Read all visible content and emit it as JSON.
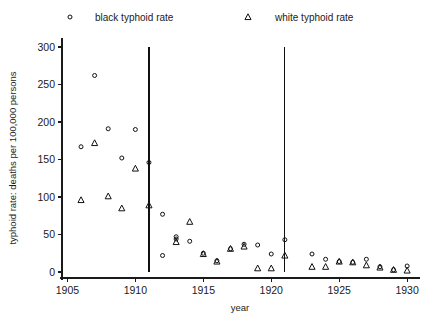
{
  "chart_data": {
    "type": "scatter",
    "title": "",
    "xlabel": "year",
    "ylabel": "typhoid rate: deaths per 100,000 persons",
    "xlim": [
      1904.6,
      1930.8
    ],
    "ylim": [
      -8,
      312
    ],
    "grid": false,
    "legend_position": "top",
    "x_ticks": [
      1905,
      1910,
      1915,
      1920,
      1925,
      1930
    ],
    "x_tick_labels": [
      "1905",
      "1910",
      "1915",
      "1920",
      "1925",
      "1930"
    ],
    "y_ticks": [
      0,
      50,
      100,
      150,
      200,
      250,
      300
    ],
    "y_tick_labels": [
      "0",
      "50",
      "100",
      "150",
      "200",
      "250",
      "300"
    ],
    "annotations": [
      {
        "name": "vertical-line-1911",
        "x": 1911,
        "y0": 0,
        "y1": 300
      },
      {
        "name": "vertical-line-1921",
        "x": 1921,
        "y0": 0,
        "y1": 300
      }
    ],
    "series": [
      {
        "name": "black typhoid rate",
        "marker": "circle",
        "color": "#111111",
        "x": [
          1906,
          1907,
          1908,
          1909,
          1910,
          1911,
          1912,
          1913,
          1914,
          1915,
          1916,
          1917,
          1918,
          1919,
          1920,
          1921,
          1923,
          1924,
          1925,
          1926,
          1927,
          1928,
          1929,
          1930
        ],
        "values": [
          167,
          262,
          191,
          152,
          190,
          146,
          77,
          44,
          41,
          25,
          15,
          31,
          37,
          36,
          24,
          43,
          24,
          17,
          14,
          13,
          17,
          7,
          3,
          8
        ]
      },
      {
        "name": "white typhoid rate",
        "marker": "triangle",
        "color": "#111111",
        "x": [
          1906,
          1907,
          1908,
          1909,
          1910,
          1911,
          1913,
          1914,
          1915,
          1916,
          1917,
          1918,
          1919,
          1920,
          1921,
          1923,
          1924,
          1925,
          1926,
          1927,
          1928,
          1929,
          1930
        ],
        "values": [
          96,
          172,
          101,
          85,
          138,
          89,
          40,
          67,
          24,
          14,
          31,
          34,
          5,
          5,
          22,
          7,
          7,
          14,
          13,
          9,
          6,
          3,
          2
        ]
      },
      {
        "name": "black typhoid rate extra",
        "marker": "circle",
        "color": "#111111",
        "x": [
          1912,
          1913
        ],
        "values": [
          22,
          47
        ]
      }
    ]
  },
  "legend": {
    "entries": [
      {
        "label": "black typhoid rate",
        "marker": "circle"
      },
      {
        "label": "white typhoid rate",
        "marker": "triangle"
      }
    ]
  }
}
